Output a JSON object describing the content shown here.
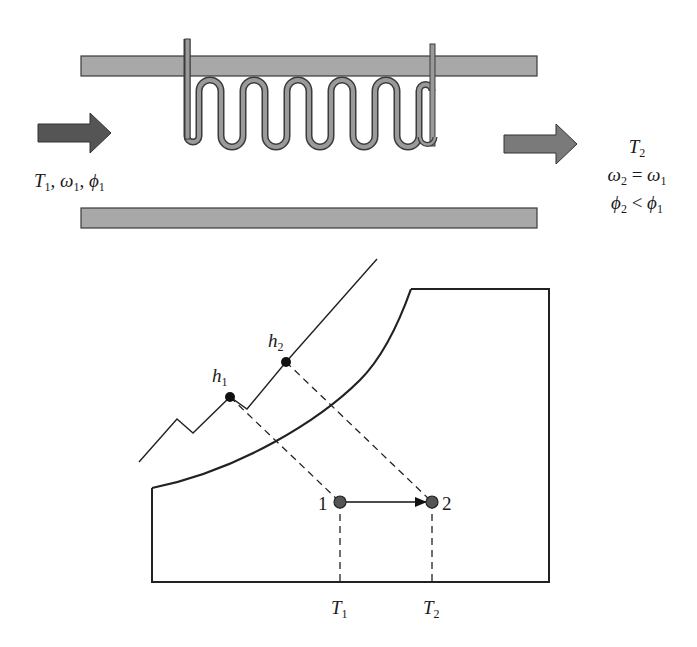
{
  "diagram": {
    "type": "heating-coil-psychrometric",
    "colors": {
      "duct_fill": "#a8a8a8",
      "duct_stroke": "#3a3a3a",
      "coil_fill": "#9a9a9a",
      "arrow_in": "#555555",
      "arrow_out": "#7a7a7a",
      "line": "#222222",
      "point": "#555555"
    },
    "inlet": {
      "label_T": "T",
      "label_T_sub": "1",
      "label_w": "ω",
      "label_w_sub": "1",
      "label_phi": "ϕ",
      "label_phi_sub": "1",
      "sep": ", "
    },
    "outlet": {
      "line1_T": "T",
      "line1_T_sub": "2",
      "line2_lhs": "ω",
      "line2_lhs_sub": "2",
      "line2_op": " = ",
      "line2_rhs": "ω",
      "line2_rhs_sub": "1",
      "line3_lhs": "ϕ",
      "line3_lhs_sub": "2",
      "line3_op": " < ",
      "line3_rhs": "ϕ",
      "line3_rhs_sub": "1"
    },
    "chart": {
      "enthalpy_labels": [
        {
          "sym": "h",
          "sub": "1"
        },
        {
          "sym": "h",
          "sub": "2"
        }
      ],
      "state_points": [
        {
          "id": "1",
          "label": "1"
        },
        {
          "id": "2",
          "label": "2"
        }
      ],
      "temperature_labels": [
        {
          "sym": "T",
          "sub": "1"
        },
        {
          "sym": "T",
          "sub": "2"
        }
      ],
      "process": "sensible heating 1 → 2 at constant humidity ratio"
    }
  }
}
